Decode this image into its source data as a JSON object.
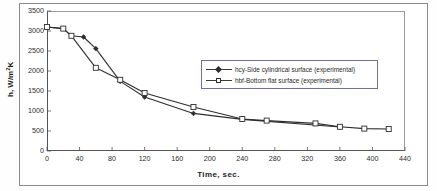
{
  "chart_data": {
    "type": "line",
    "title": "",
    "xlabel": "Time, sec.",
    "ylabel": "h, W/m²K",
    "ylabel_base": "h, W/m",
    "ylabel_sup": "2",
    "ylabel_tail": "K",
    "xlim": [
      0,
      440
    ],
    "ylim": [
      0,
      3500
    ],
    "xticks": [
      0,
      40,
      80,
      120,
      160,
      200,
      240,
      280,
      320,
      360,
      400,
      440
    ],
    "yticks": [
      0,
      500,
      1000,
      1500,
      2000,
      2500,
      3000,
      3500
    ],
    "grid": false,
    "legend_position": "center-right",
    "series": [
      {
        "name": "hcy-Side cylindrical surface (experimental)",
        "marker": "filled-diamond",
        "color": "#2e2e2e",
        "x": [
          0,
          20,
          30,
          45,
          60,
          90,
          120,
          180,
          240,
          360
        ],
        "y": [
          3100,
          3060,
          2880,
          2850,
          2560,
          1740,
          1350,
          940,
          790,
          600
        ]
      },
      {
        "name": "hbf-Bottom flat surface (experimental)",
        "marker": "open-square",
        "color": "#2e2e2e",
        "x": [
          0,
          20,
          30,
          60,
          90,
          120,
          180,
          240,
          270,
          330,
          360,
          390,
          420
        ],
        "y": [
          3100,
          3060,
          2880,
          2080,
          1780,
          1450,
          1100,
          800,
          760,
          690,
          605,
          560,
          550
        ]
      }
    ]
  },
  "legend": {
    "items": [
      {
        "label": "hcy-Side cylindrical surface (experimental)",
        "marker": "filled-diamond"
      },
      {
        "label": "hbf-Bottom flat surface (experimental)",
        "marker": "open-square"
      }
    ]
  }
}
